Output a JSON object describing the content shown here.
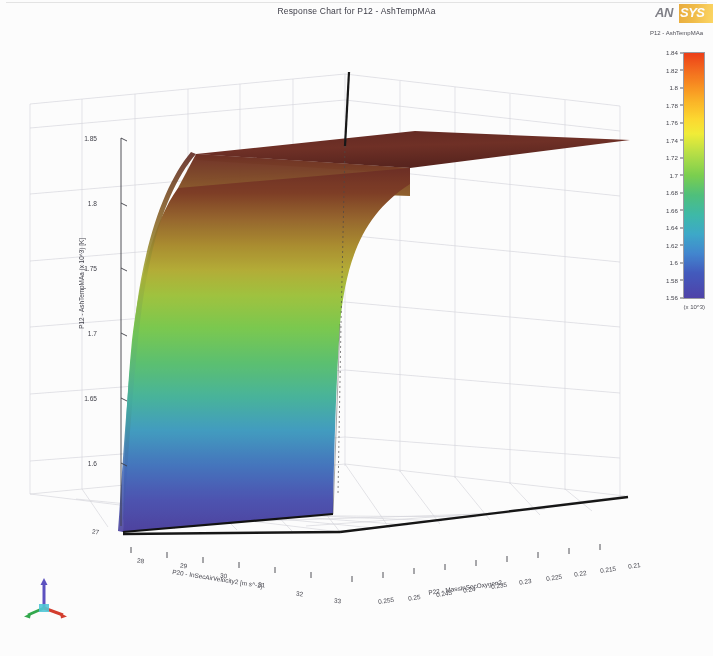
{
  "window": {
    "title": "Response Chart for P12 - AshTempMAa",
    "logo_text_a": "AN",
    "logo_text_b": "SYS"
  },
  "legend": {
    "title": "P12 - AshTempMAa",
    "multiplier": "(x 10^3)",
    "ticks": [
      "1.84",
      "1.82",
      "1.8",
      "1.78",
      "1.76",
      "1.74",
      "1.72",
      "1.7",
      "1.68",
      "1.66",
      "1.64",
      "1.62",
      "1.6",
      "1.58",
      "1.56"
    ],
    "min": 1.56,
    "max": 1.84,
    "colors": [
      "#ee3b13",
      "#ffd92c",
      "#79cf4c",
      "#3aa8c9",
      "#4c3fa8"
    ]
  },
  "chart_data": {
    "type": "surface",
    "title": "Response Chart for P12 - AshTempMAa",
    "zlabel": "P12 - AshTempMAa (x 10^3) [K]",
    "xlabel": "P20 - InSecAirVelocity2 [m s^-1]",
    "ylabel": "P22 - MassInSecOxygen2",
    "z_ticks": [
      "1.85",
      "1.8",
      "1.75",
      "1.7",
      "1.65",
      "1.6"
    ],
    "zlim": [
      1.56,
      1.86
    ],
    "x_ticks": [
      "27",
      "28",
      "29",
      "30",
      "31",
      "32",
      "33"
    ],
    "xlim": [
      27,
      33
    ],
    "y_ticks": [
      "0.255",
      "0.25",
      "0.245",
      "0.24",
      "0.235",
      "0.23",
      "0.225",
      "0.22",
      "0.215",
      "0.21"
    ],
    "ylim": [
      0.21,
      0.255
    ],
    "surface_series": [
      {
        "name": "plateau",
        "z": 1.85,
        "color": "#6b2a22"
      },
      {
        "name": "ridge",
        "z": 1.8,
        "color": "#9c8a2a"
      },
      {
        "name": "mid",
        "z": 1.72,
        "color": "#7ecb4a"
      },
      {
        "name": "lower",
        "z": 1.64,
        "color": "#3fb5a8"
      },
      {
        "name": "floor",
        "z": 1.57,
        "color": "#4a44a8"
      }
    ]
  },
  "triad": {
    "x_axis_color": "#d43a2a",
    "y_axis_color": "#2fa84a",
    "z_axis_color": "#5a4ec0"
  }
}
